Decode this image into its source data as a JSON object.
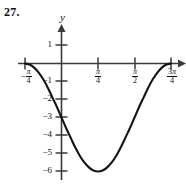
{
  "problem": {
    "number": "27."
  },
  "axes": {
    "y_label": "y",
    "x_label": "",
    "x_ticks": [
      {
        "value": -0.7853981634,
        "label_tex": "-pi/4",
        "sign": "−",
        "num": "π",
        "den": "4"
      },
      {
        "value": 0.7853981634,
        "label_tex": "pi/4",
        "sign": "",
        "num": "π",
        "den": "4"
      },
      {
        "value": 1.5707963268,
        "label_tex": "pi/2",
        "sign": "",
        "num": "π",
        "den": "2"
      },
      {
        "value": 2.3561944902,
        "label_tex": "3pi/4",
        "sign": "",
        "num": "3π",
        "den": "4"
      }
    ],
    "y_ticks": [
      {
        "value": 1,
        "label": "1"
      },
      {
        "value": -1,
        "label": "−1"
      },
      {
        "value": -2,
        "label": "−2"
      },
      {
        "value": -3,
        "label": "−3"
      },
      {
        "value": -4,
        "label": "−4"
      },
      {
        "value": -5,
        "label": "−5"
      },
      {
        "value": -6,
        "label": "−6"
      }
    ],
    "xlim": [
      -1.1780972451,
      2.7488935719
    ],
    "ylim": [
      -6.6,
      1.6
    ],
    "axis_color": "#3a3a3a",
    "curve_color": "#141414"
  },
  "chart_data": {
    "type": "line",
    "title": "",
    "subtitle": "",
    "xlabel": "",
    "ylabel": "y",
    "grid": false,
    "legend": null,
    "equation": "y = -3 - 3 sin(2x)",
    "amplitude": 3,
    "midline": -3,
    "period_radians": 3.1415926536,
    "xlim": [
      -1.1780972451,
      2.7488935719
    ],
    "ylim": [
      -6.6,
      1.6
    ],
    "x_tick_values": [
      -0.7853981634,
      0.7853981634,
      1.5707963268,
      2.3561944902
    ],
    "x_tick_labels": [
      "-π/4",
      "π/4",
      "π/2",
      "3π/4"
    ],
    "y_tick_values": [
      1,
      -1,
      -2,
      -3,
      -4,
      -5,
      -6
    ],
    "y_tick_labels": [
      "1",
      "−1",
      "−2",
      "−3",
      "−4",
      "−5",
      "−6"
    ],
    "key_points": [
      {
        "x": -0.7853981634,
        "y": 0,
        "note": "start, maximum, x = -π/4"
      },
      {
        "x": 0,
        "y": -3,
        "note": "y-intercept"
      },
      {
        "x": 0.7853981634,
        "y": -6,
        "note": "minimum, x = π/4"
      },
      {
        "x": 1.5707963268,
        "y": -3,
        "note": "midline, x = π/2"
      },
      {
        "x": 2.3561944902,
        "y": 0,
        "note": "end, maximum, x = 3π/4"
      }
    ],
    "series": [
      {
        "name": "y = -3 - 3 sin(2x)",
        "x": [
          -0.7853981634,
          -0.687223393,
          -0.5890486225,
          -0.4908738521,
          -0.3926990817,
          -0.2945243113,
          -0.1963495408,
          -0.0981747704,
          0.0,
          0.0981747704,
          0.1963495408,
          0.2945243113,
          0.3926990817,
          0.4908738521,
          0.5890486225,
          0.687223393,
          0.7853981634,
          0.8835729338,
          0.9817477042,
          1.0799224747,
          1.1780972451,
          1.2762720155,
          1.3744467859,
          1.4726215564,
          1.5707963268,
          1.6689710972,
          1.7671458676,
          1.8653206381,
          1.9634954085,
          2.0616701789,
          2.1598449493,
          2.2580197198,
          2.3561944902
        ],
        "y": [
          0.0,
          -0.0576,
          -0.2283,
          -0.5025,
          -0.8787,
          -1.3431,
          -1.8815,
          -2.4147,
          -3.0,
          -3.5853,
          -4.1185,
          -4.6569,
          -5.1213,
          -5.4975,
          -5.7717,
          -5.9424,
          -6.0,
          -5.9424,
          -5.7717,
          -5.4975,
          -5.1213,
          -4.6569,
          -4.1185,
          -3.5853,
          -3.0,
          -2.4147,
          -1.8815,
          -1.3431,
          -0.8787,
          -0.5025,
          -0.2283,
          -0.0576,
          0.0
        ]
      }
    ]
  }
}
